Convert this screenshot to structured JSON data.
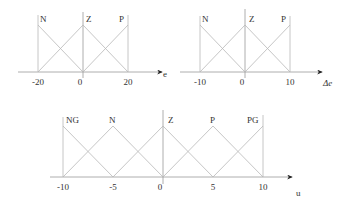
{
  "diagrams": [
    {
      "id": "e",
      "axis_label": "e",
      "ticks": [
        "-20",
        "0",
        "20"
      ],
      "sets": [
        "N",
        "Z",
        "P"
      ],
      "range": [
        -20,
        20
      ]
    },
    {
      "id": "de",
      "axis_label": "Δe",
      "ticks": [
        "-10",
        "0",
        "10"
      ],
      "sets": [
        "N",
        "Z",
        "P"
      ],
      "range": [
        -10,
        10
      ]
    },
    {
      "id": "u",
      "axis_label": "u",
      "ticks": [
        "-10",
        "-5",
        "0",
        "5",
        "10"
      ],
      "sets": [
        "NG",
        "N",
        "Z",
        "P",
        "PG"
      ],
      "range": [
        -10,
        10
      ]
    }
  ],
  "colors": {
    "line": "#b8b8b8",
    "axis": "#9a9a9a",
    "text": "#333333"
  }
}
